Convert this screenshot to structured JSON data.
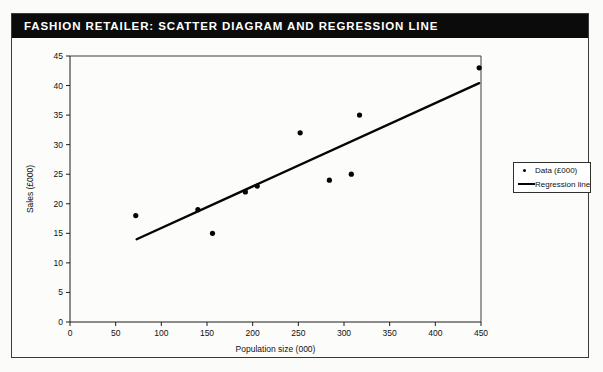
{
  "figure": {
    "title": "FASHION RETAILER: SCATTER DIAGRAM AND REGRESSION LINE"
  },
  "legend": {
    "position": "right",
    "entries": [
      {
        "label": "Data (£000)",
        "marker": "dot"
      },
      {
        "label": "Regression line",
        "marker": "line"
      }
    ]
  },
  "chart_data": {
    "type": "scatter",
    "title": "FASHION RETAILER: SCATTER DIAGRAM AND REGRESSION LINE",
    "xlabel": "Population size (000)",
    "ylabel": "Sales (£000)",
    "xlim": [
      0,
      450
    ],
    "ylim": [
      0,
      45
    ],
    "xticks": [
      0,
      50,
      100,
      150,
      200,
      250,
      300,
      350,
      400,
      450
    ],
    "yticks": [
      0,
      5,
      10,
      15,
      20,
      25,
      30,
      35,
      40,
      45
    ],
    "grid": false,
    "legend_position": "right",
    "series": [
      {
        "name": "Data (£000)",
        "type": "scatter",
        "marker": "dot",
        "color": "#050505",
        "points": [
          {
            "x": 72,
            "y": 18
          },
          {
            "x": 140,
            "y": 19
          },
          {
            "x": 156,
            "y": 15
          },
          {
            "x": 192,
            "y": 22
          },
          {
            "x": 205,
            "y": 23
          },
          {
            "x": 252,
            "y": 32
          },
          {
            "x": 284,
            "y": 24
          },
          {
            "x": 308,
            "y": 25
          },
          {
            "x": 317,
            "y": 35
          },
          {
            "x": 448,
            "y": 43
          }
        ]
      },
      {
        "name": "Regression line",
        "type": "line",
        "color": "#050505",
        "endpoints": [
          {
            "x": 73,
            "y": 14.0
          },
          {
            "x": 448,
            "y": 40.4
          }
        ]
      }
    ]
  }
}
